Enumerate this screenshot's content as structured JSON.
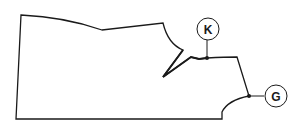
{
  "diagram": {
    "type": "sewing-pattern-piece",
    "stroke_color": "#1a1a1a",
    "background": "#ffffff",
    "markers": [
      {
        "id": "K",
        "label": "K"
      },
      {
        "id": "G",
        "label": "G"
      }
    ]
  }
}
